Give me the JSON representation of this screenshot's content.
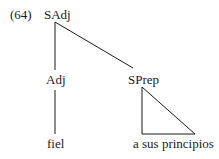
{
  "example_number": "(64)",
  "tree": {
    "root": {
      "label": "SAdj"
    },
    "children": [
      {
        "label": "Adj",
        "leaf": "fiel"
      },
      {
        "label": "SPrep",
        "leaf": "a sus principios",
        "collapsed": true
      }
    ]
  },
  "colors": {
    "line": "#1a1a1a",
    "text": "#1a1a1a",
    "background": "#ffffff"
  }
}
